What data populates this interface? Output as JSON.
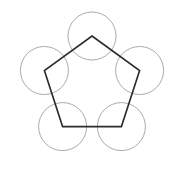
{
  "figure": {
    "canvas": {
      "width": 184,
      "height": 193,
      "background": "#ffffff"
    },
    "colors": {
      "background": "#ffffff",
      "pentagon_stroke": "#2b2b2b",
      "circle_stroke": "#a9a9a9"
    },
    "pentagon": {
      "name": "regular-pentagon",
      "center": {
        "x": 92,
        "y": 86
      },
      "circumradius": 50,
      "rotation_deg": -90,
      "stroke_width": 1.6,
      "fill": "none",
      "vertices": [
        {
          "label": "top",
          "x": 92,
          "y": 36
        },
        {
          "label": "right-upper",
          "x": 139.6,
          "y": 70.5
        },
        {
          "label": "right-lower",
          "x": 121.4,
          "y": 126.6
        },
        {
          "label": "left-lower",
          "x": 62.6,
          "y": 126.6
        },
        {
          "label": "left-upper",
          "x": 44.4,
          "y": 70.5
        }
      ]
    },
    "circles": {
      "name": "vertex-circles",
      "radius": 24,
      "stroke_width": 1,
      "fill": "none",
      "items": [
        {
          "label": "circle-top",
          "cx": 92,
          "cy": 36
        },
        {
          "label": "circle-right-upper",
          "cx": 139.6,
          "cy": 70.5
        },
        {
          "label": "circle-right-lower",
          "cx": 121.4,
          "cy": 126.6
        },
        {
          "label": "circle-left-lower",
          "cx": 62.6,
          "cy": 126.6
        },
        {
          "label": "circle-left-upper",
          "cx": 44.4,
          "cy": 70.5
        }
      ]
    }
  }
}
